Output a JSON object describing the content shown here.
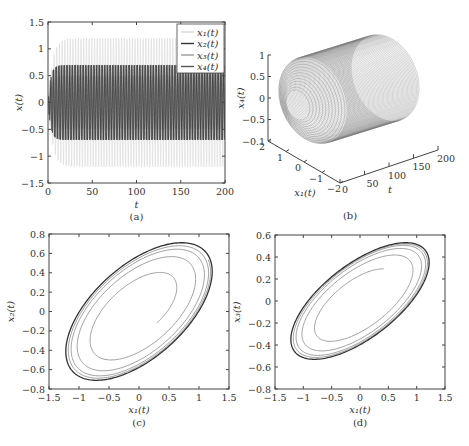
{
  "figure": {
    "caption_fragment": "Figure ...",
    "panels": [
      "(a)",
      "(b)",
      "(c)",
      "(d)"
    ]
  },
  "chart_data": [
    {
      "id": "a",
      "type": "line",
      "panel_label": "(a)",
      "xlabel": "t",
      "ylabel": "x(t)",
      "xlim": [
        0,
        200
      ],
      "ylim": [
        -1.5,
        1.5
      ],
      "xticks": [
        "0",
        "50",
        "100",
        "150",
        "200"
      ],
      "yticks": [
        "-1.5",
        "-1",
        "-0.5",
        "0",
        "0.5",
        "1",
        "1.5"
      ],
      "legend": {
        "position": "upper right",
        "entries": [
          "x1(t)",
          "x2(t)",
          "x3(t)",
          "x4(t)"
        ]
      },
      "series": [
        {
          "name": "x1(t)",
          "amplitude": 1.2,
          "color": "#d8d8d8"
        },
        {
          "name": "x2(t)",
          "amplitude": 0.7,
          "color": "#333333"
        },
        {
          "name": "x3(t)",
          "amplitude": 0.5,
          "color": "#999999"
        },
        {
          "name": "x4(t)",
          "amplitude": 0.7,
          "color": "#555555"
        }
      ],
      "notes": "Oscillations reach steady amplitude after t≈15; x1 ≈ ±1.2, x2/x4 ≈ ±0.7"
    },
    {
      "id": "b",
      "type": "line",
      "subtype": "3d",
      "panel_label": "(b)",
      "xlabel": "t",
      "ylabel": "x1(t)",
      "zlabel": "x4(t)",
      "t_ticks": [
        "0",
        "50",
        "100",
        "150",
        "200"
      ],
      "x1_ticks": [
        "2",
        "1",
        "0",
        "-1",
        "-2"
      ],
      "z_ticks": [
        "1",
        "0.5",
        "0",
        "-0.5",
        "-0.1"
      ],
      "notes": "Helical trajectory forming cylinder along t axis"
    },
    {
      "id": "c",
      "type": "line",
      "subtype": "phase",
      "panel_label": "(c)",
      "xlabel": "x1(t)",
      "ylabel": "x2(t)",
      "xlim": [
        -1.5,
        1.5
      ],
      "ylim": [
        -0.8,
        0.8
      ],
      "xticks": [
        "-1.5",
        "-1",
        "-0.5",
        "0",
        "0.5",
        "1",
        "1.5"
      ],
      "yticks": [
        "-0.8",
        "-0.6",
        "-0.4",
        "-0.2",
        "0",
        "0.2",
        "0.4",
        "0.6",
        "0.8"
      ],
      "limit_cycle": {
        "x_range": [
          -1.22,
          1.22
        ],
        "y_range": [
          -0.7,
          0.7
        ]
      },
      "start_point": [
        0.2,
        -0.3
      ]
    },
    {
      "id": "d",
      "type": "line",
      "subtype": "phase",
      "panel_label": "(d)",
      "xlabel": "x1(t)",
      "ylabel": "x3(t)",
      "xlim": [
        -1.5,
        1.5
      ],
      "ylim": [
        -0.8,
        0.6
      ],
      "xticks": [
        "-1.5",
        "-1",
        "-0.5",
        "0",
        "0.5",
        "1",
        "1.5"
      ],
      "yticks": [
        "-0.8",
        "-0.6",
        "-0.4",
        "-0.2",
        "0",
        "0.2",
        "0.4",
        "0.6"
      ],
      "limit_cycle": {
        "x_range": [
          -1.22,
          1.22
        ],
        "y_range": [
          -0.53,
          0.52
        ]
      },
      "start_point": [
        0.25,
        0.3
      ]
    }
  ]
}
